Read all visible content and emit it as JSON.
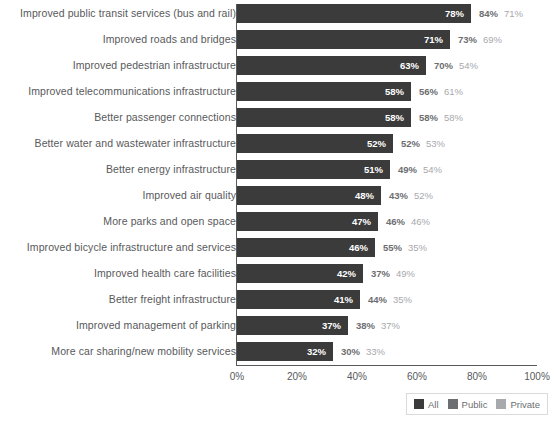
{
  "chart_data": {
    "type": "bar",
    "orientation": "horizontal",
    "title": "",
    "subtitle": "",
    "xlabel": "",
    "ylabel": "",
    "xlim": [
      0,
      100
    ],
    "xticks": [
      "0%",
      "20%",
      "40%",
      "60%",
      "80%",
      "100%"
    ],
    "xtick_values": [
      0,
      20,
      40,
      60,
      80,
      100
    ],
    "grid": false,
    "legend_position": "bottom-right",
    "value_suffix": "%",
    "plotted_series": "All",
    "categories": [
      "Improved public transit services (bus and rail)",
      "Improved roads and bridges",
      "Improved pedestrian infrastructure",
      "Improved telecommunications infrastructure",
      "Better passenger connections",
      "Better water and wastewater infrastructure",
      "Better energy infrastructure",
      "Improved air quality",
      "More parks and open space",
      "Improved bicycle infrastructure and services",
      "Improved health care facilities",
      "Better freight infrastructure",
      "Improved management of parking",
      "More car sharing/new mobility services"
    ],
    "series": [
      {
        "name": "All",
        "values": [
          78,
          71,
          63,
          58,
          58,
          52,
          51,
          48,
          47,
          46,
          42,
          41,
          37,
          32
        ],
        "labels": [
          "78%",
          "71%",
          "63%",
          "58%",
          "58%",
          "52%",
          "51%",
          "48%",
          "47%",
          "46%",
          "42%",
          "41%",
          "37%",
          "32%"
        ],
        "color": "#3b3b3b"
      },
      {
        "name": "Public",
        "values": [
          84,
          73,
          70,
          56,
          58,
          52,
          49,
          43,
          46,
          55,
          37,
          44,
          38,
          30
        ],
        "labels": [
          "84%",
          "73%",
          "70%",
          "56%",
          "58%",
          "52%",
          "49%",
          "43%",
          "46%",
          "55%",
          "37%",
          "44%",
          "38%",
          "30%"
        ],
        "color": "#6d6e71"
      },
      {
        "name": "Private",
        "values": [
          71,
          69,
          54,
          61,
          58,
          53,
          54,
          52,
          46,
          35,
          49,
          35,
          37,
          33
        ],
        "labels": [
          "71%",
          "69%",
          "54%",
          "61%",
          "58%",
          "53%",
          "54%",
          "52%",
          "46%",
          "35%",
          "49%",
          "35%",
          "37%",
          "33%"
        ],
        "color": "#a7a9ac"
      }
    ],
    "legend": [
      {
        "label": "All",
        "color": "#3b3b3b"
      },
      {
        "label": "Public",
        "color": "#6d6e71"
      },
      {
        "label": "Private",
        "color": "#a7a9ac"
      }
    ]
  },
  "colors": {
    "bar": "#3b3b3b",
    "axis": "#58595b",
    "label_text": "#58595b",
    "public_text": "#6d6e71",
    "private_text": "#a7a9ac",
    "background": "#ffffff",
    "legend_border": "#d9dadb"
  }
}
